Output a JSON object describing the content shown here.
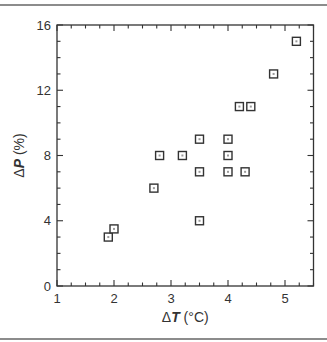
{
  "chart_data": {
    "type": "scatter",
    "title": "",
    "xlabel": "ΔT (°C)",
    "ylabel": "ΔP (%)",
    "xlabel_parts": {
      "delta": "Δ",
      "var": "T",
      "unit": " (°C)"
    },
    "ylabel_parts": {
      "delta": "Δ",
      "var": "P",
      "unit": " (%)"
    },
    "xlim": [
      1,
      5.5
    ],
    "ylim": [
      0,
      16
    ],
    "xticks": [
      1,
      2,
      3,
      4,
      5
    ],
    "yticks": [
      0,
      4,
      8,
      12,
      16
    ],
    "x_minor_step": 0.25,
    "y_minor_step": 1,
    "grid": false,
    "legend": null,
    "marker": "open-square",
    "marker_color": "#333333",
    "series": [
      {
        "name": "data",
        "points": [
          {
            "x": 1.9,
            "y": 3
          },
          {
            "x": 2.0,
            "y": 3.5
          },
          {
            "x": 2.7,
            "y": 6
          },
          {
            "x": 2.8,
            "y": 8
          },
          {
            "x": 3.2,
            "y": 8
          },
          {
            "x": 3.5,
            "y": 4
          },
          {
            "x": 3.5,
            "y": 7
          },
          {
            "x": 3.5,
            "y": 9
          },
          {
            "x": 4.0,
            "y": 7
          },
          {
            "x": 4.0,
            "y": 8
          },
          {
            "x": 4.0,
            "y": 9
          },
          {
            "x": 4.3,
            "y": 7
          },
          {
            "x": 4.2,
            "y": 11
          },
          {
            "x": 4.4,
            "y": 11
          },
          {
            "x": 4.8,
            "y": 13
          },
          {
            "x": 5.2,
            "y": 15
          }
        ]
      }
    ]
  }
}
